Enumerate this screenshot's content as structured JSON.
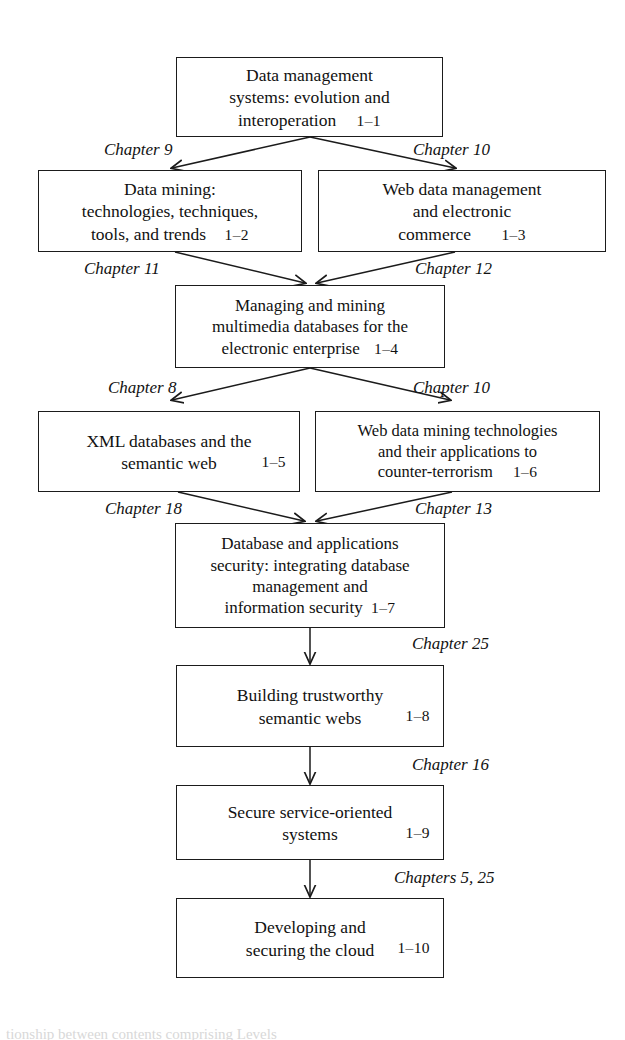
{
  "figure": {
    "box_border_color": "#1b1b1b",
    "background_color": "#ffffff",
    "text_color": "#111111"
  },
  "nodes": [
    {
      "id": "node-1-1",
      "name": "data-management-systems",
      "lines": [
        "Data management",
        "systems: evolution and",
        "interoperation"
      ],
      "tag": "1–1"
    },
    {
      "id": "node-1-2",
      "name": "data-mining",
      "lines": [
        "Data mining:",
        "technologies, techniques,",
        "tools, and trends"
      ],
      "tag": "1–2"
    },
    {
      "id": "node-1-3",
      "name": "web-data-management",
      "lines": [
        "Web data management",
        "and electronic",
        "commerce"
      ],
      "tag": "1–3"
    },
    {
      "id": "node-1-4",
      "name": "managing-mining-multimedia",
      "lines": [
        "Managing and mining",
        "multimedia databases for the",
        "electronic enterprise"
      ],
      "tag": "1–4"
    },
    {
      "id": "node-1-5",
      "name": "xml-databases-semantic-web",
      "lines": [
        "XML databases and the",
        "semantic web"
      ],
      "tag": "1–5"
    },
    {
      "id": "node-1-6",
      "name": "web-data-mining-counter-terrorism",
      "lines": [
        "Web data mining technologies",
        "and their applications to",
        "counter-terrorism"
      ],
      "tag": "1–6"
    },
    {
      "id": "node-1-7",
      "name": "database-applications-security",
      "lines": [
        "Database and applications",
        "security: integrating database",
        "management and",
        "information security"
      ],
      "tag": "1–7"
    },
    {
      "id": "node-1-8",
      "name": "building-trustworthy-semantic-webs",
      "lines": [
        "Building trustworthy",
        "semantic webs"
      ],
      "tag": "1–8"
    },
    {
      "id": "node-1-9",
      "name": "secure-service-oriented-systems",
      "lines": [
        "Secure service-oriented",
        "systems"
      ],
      "tag": "1–9"
    },
    {
      "id": "node-1-10",
      "name": "developing-securing-cloud",
      "lines": [
        "Developing and",
        "securing the cloud"
      ],
      "tag": "1–10"
    }
  ],
  "edge_labels": [
    {
      "id": "lbl-ch9",
      "text": "Chapter 9"
    },
    {
      "id": "lbl-ch10a",
      "text": "Chapter 10"
    },
    {
      "id": "lbl-ch11",
      "text": "Chapter 11"
    },
    {
      "id": "lbl-ch12",
      "text": "Chapter 12"
    },
    {
      "id": "lbl-ch8",
      "text": "Chapter 8"
    },
    {
      "id": "lbl-ch10b",
      "text": "Chapter 10"
    },
    {
      "id": "lbl-ch18",
      "text": "Chapter 18"
    },
    {
      "id": "lbl-ch13",
      "text": "Chapter 13"
    },
    {
      "id": "lbl-ch25",
      "text": "Chapter 25"
    },
    {
      "id": "lbl-ch16",
      "text": "Chapter 16"
    },
    {
      "id": "lbl-ch5-25",
      "text": "Chapters 5, 25"
    }
  ],
  "footer": {
    "clipped_caption": "tionship between contents comprising Levels"
  }
}
